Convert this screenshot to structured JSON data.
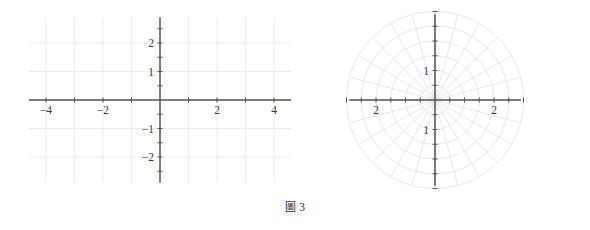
{
  "figure": {
    "caption_glyph": "圖",
    "caption_number": "3",
    "colors": {
      "axis": "#555555",
      "grid": "#e9e9ef",
      "polar_grid": "#e3e3ea",
      "label": "#3c3c3c",
      "background": "#ffffff"
    }
  },
  "chart_data": [
    {
      "type": "scatter",
      "name": "cartesian-grid",
      "title": "",
      "xlabel": "",
      "ylabel": "",
      "grid": true,
      "legend": "none",
      "xlim": [
        -4.6,
        4.6
      ],
      "ylim": [
        -2.9,
        2.9
      ],
      "x_ticks": [
        -4,
        -2,
        2,
        4
      ],
      "x_tick_labels": [
        "-4",
        "-2",
        "2",
        "4"
      ],
      "y_ticks": [
        2,
        1,
        -1,
        -2
      ],
      "y_tick_labels": [
        "2",
        "1",
        "-1",
        "-2"
      ],
      "x_minor_ticks": [
        -4,
        -3,
        -2,
        -1,
        1,
        2,
        3,
        4
      ],
      "y_minor_ticks": [
        -2.5,
        -2,
        -1.5,
        -1,
        -0.5,
        0.5,
        1,
        1.5,
        2,
        2.5
      ],
      "x_gridlines": [
        -4,
        -3,
        -2,
        -1,
        0,
        1,
        2,
        3,
        4
      ],
      "y_gridlines": [
        -2,
        -1,
        0,
        1,
        2
      ],
      "series": []
    },
    {
      "type": "scatter",
      "name": "polar-grid",
      "title": "",
      "xlabel": "",
      "ylabel": "",
      "grid": true,
      "legend": "none",
      "coordinate_system": "polar",
      "xlim": [
        -3.0,
        3.0
      ],
      "ylim": [
        -3.0,
        3.0
      ],
      "x_ticks": [
        -2,
        2
      ],
      "x_tick_labels": [
        "2",
        "2"
      ],
      "y_ticks": [
        1,
        -1
      ],
      "y_tick_labels": [
        "1",
        "1"
      ],
      "radial_rings": [
        0.5,
        1.0,
        1.5,
        2.0,
        2.5,
        3.0
      ],
      "angular_spokes_deg": [
        0,
        15,
        30,
        45,
        60,
        75,
        90,
        105,
        120,
        135,
        150,
        165,
        180,
        195,
        210,
        225,
        240,
        255,
        270,
        285,
        300,
        315,
        330,
        345
      ],
      "spoke_count": 24,
      "ring_count": 6,
      "series": []
    }
  ]
}
